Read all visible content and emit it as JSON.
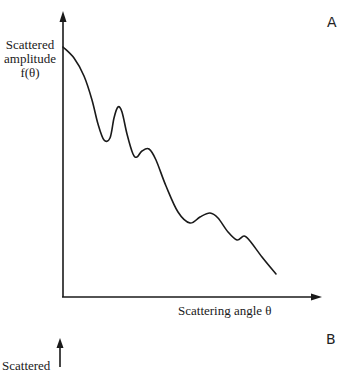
{
  "panels": [
    {
      "letter": "A",
      "y_label_lines": [
        "Scattered",
        "amplitude",
        "f(θ)"
      ],
      "x_label": "Scattering angle θ"
    },
    {
      "letter": "B",
      "y_label_partial": "Scattered"
    }
  ],
  "colors": {
    "ink": "#1a1a1a",
    "background": "#ffffff"
  },
  "curve_points": [
    [
      63,
      47
    ],
    [
      74,
      58
    ],
    [
      84,
      76
    ],
    [
      92,
      100
    ],
    [
      98,
      124
    ],
    [
      104,
      140
    ],
    [
      110,
      138
    ],
    [
      114,
      118
    ],
    [
      118,
      107
    ],
    [
      122,
      112
    ],
    [
      127,
      134
    ],
    [
      133,
      154
    ],
    [
      137,
      157
    ],
    [
      142,
      151
    ],
    [
      149,
      149
    ],
    [
      156,
      160
    ],
    [
      166,
      186
    ],
    [
      178,
      212
    ],
    [
      190,
      223
    ],
    [
      200,
      217
    ],
    [
      210,
      213
    ],
    [
      218,
      218
    ],
    [
      228,
      232
    ],
    [
      237,
      240
    ],
    [
      244,
      236
    ],
    [
      250,
      241
    ],
    [
      262,
      257
    ],
    [
      276,
      274
    ]
  ]
}
